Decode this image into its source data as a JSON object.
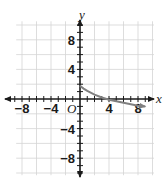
{
  "chart_data": {
    "type": "line",
    "title": "",
    "xlabel": "x",
    "ylabel": "y",
    "origin_label": "O",
    "xlim": [
      -10,
      10
    ],
    "ylim": [
      -10,
      10
    ],
    "grid": true,
    "grid_step": 2,
    "minor_tick_step": 1,
    "x_ticks": [
      {
        "value": -8,
        "label": "−8"
      },
      {
        "value": -4,
        "label": "−4"
      },
      {
        "value": 4,
        "label": "4"
      },
      {
        "value": 8,
        "label": "8"
      }
    ],
    "y_ticks": [
      {
        "value": 8,
        "label": "8"
      },
      {
        "value": 4,
        "label": "4"
      },
      {
        "value": -4,
        "label": "−4"
      },
      {
        "value": -8,
        "label": "−8"
      }
    ],
    "series": [
      {
        "name": "curve",
        "color": "#808080",
        "end_arrow": true,
        "points": [
          [
            0,
            1.8
          ],
          [
            0.5,
            1.4
          ],
          [
            1,
            1.1
          ],
          [
            2,
            0.6
          ],
          [
            3,
            0.2
          ],
          [
            4,
            -0.1
          ],
          [
            5,
            -0.3
          ],
          [
            6,
            -0.5
          ],
          [
            7,
            -0.7
          ],
          [
            8,
            -0.9
          ],
          [
            9,
            -1.0
          ]
        ]
      }
    ]
  }
}
